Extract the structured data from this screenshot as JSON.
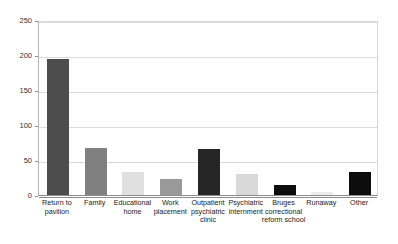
{
  "chart_data": {
    "type": "bar",
    "title": "",
    "xlabel": "",
    "ylabel": "",
    "ylim": [
      0,
      250
    ],
    "yticks": [
      0,
      50,
      100,
      150,
      200,
      250
    ],
    "grid": true,
    "legend": "none",
    "categories": [
      "Return to pavilion",
      "Family",
      "Educational home",
      "Work placement",
      "Outpatient psychiatric clinic",
      "Psychiatric internment",
      "Bruges correctional reform school",
      "Runaway",
      "Other"
    ],
    "values": [
      195,
      67,
      33,
      23,
      66,
      30,
      15,
      5,
      33
    ],
    "bar_colors": [
      "#4d4d4d",
      "#808080",
      "#e0e0e0",
      "#999999",
      "#262626",
      "#d9d9d9",
      "#0d0d0d",
      "#ebebeb",
      "#0d0d0d"
    ]
  },
  "axis": {
    "tick_labels": [
      "0",
      "50",
      "100",
      "150",
      "200",
      "250"
    ],
    "gridline_color": "#dcdcdc",
    "axis_color": "#8c8c8c"
  }
}
